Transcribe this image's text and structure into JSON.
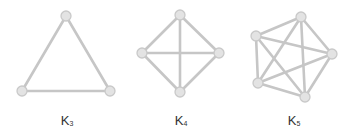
{
  "graphs": [
    {
      "name": "K",
      "subscript": "3",
      "label_x": 67,
      "label_y": 113,
      "nodes": [
        [
          66,
          16
        ],
        [
          22,
          91
        ],
        [
          110,
          91
        ]
      ]
    },
    {
      "name": "K",
      "subscript": "4",
      "label_x": 181,
      "label_y": 113,
      "nodes": [
        [
          180,
          15
        ],
        [
          142,
          53
        ],
        [
          219,
          53
        ],
        [
          180,
          92
        ]
      ]
    },
    {
      "name": "K",
      "subscript": "5",
      "label_x": 294,
      "label_y": 113,
      "nodes": [
        [
          301,
          17
        ],
        [
          256,
          36
        ],
        [
          332,
          54
        ],
        [
          258,
          83
        ],
        [
          305,
          97
        ]
      ]
    }
  ],
  "colors": {
    "edge": "#c6c6c6",
    "node_fill": "#e3e3e3",
    "node_stroke": "#c9c9c9",
    "label": "#333333"
  }
}
